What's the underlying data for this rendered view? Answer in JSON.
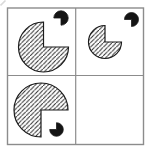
{
  "figure": {
    "width": 150,
    "height": 149,
    "colors": {
      "background": "#ffffff",
      "grid_stroke": "#8c8c8c",
      "shape_stroke": "#1b1b1b",
      "hatch_stroke": "#2a2a2a",
      "dot_fill": "#141414",
      "smudge": "#d9d9d9"
    },
    "grid": {
      "outer": {
        "x": 7.5,
        "y": 8,
        "w": 136,
        "h": 136.5
      },
      "v_divider_x": 75.7,
      "h_divider_y": 75.5,
      "outer_stroke_width": 1.4,
      "divider_stroke_width": 1.2
    },
    "hatch": {
      "spacing": 4.3,
      "stroke_width": 1.0,
      "direction": "anti-diagonal"
    },
    "smudge_line": {
      "x1": 0.5,
      "y1": 5.5,
      "x2": 5.5,
      "y2": 0.5,
      "stroke_width": 1.6
    },
    "cells": [
      {
        "id": "cell-top-left",
        "shapes": [
          {
            "name": "hatched-pacman-large",
            "type": "pacman",
            "cx": 43.5,
            "cy": 47,
            "r": 25,
            "missing_quadrant": "top-right",
            "fill": "hatch",
            "stroke_width": 1.2
          },
          {
            "name": "black-dot-notched",
            "type": "pacman",
            "cx": 61,
            "cy": 18,
            "r": 7.2,
            "missing_quadrant": "bottom-left",
            "fill": "solid",
            "stroke_width": 0.8
          }
        ]
      },
      {
        "id": "cell-top-right",
        "shapes": [
          {
            "name": "hatched-pacman-small",
            "type": "pacman",
            "cx": 105,
            "cy": 42,
            "r": 16.5,
            "missing_quadrant": "top-right",
            "fill": "hatch",
            "stroke_width": 1.2
          },
          {
            "name": "black-dot-notched",
            "type": "pacman",
            "cx": 131.5,
            "cy": 19.5,
            "r": 7,
            "missing_quadrant": "bottom-left",
            "fill": "solid",
            "stroke_width": 0.8
          }
        ]
      },
      {
        "id": "cell-bottom-left",
        "shapes": [
          {
            "name": "hatched-pacman-large",
            "type": "pacman",
            "cx": 41,
            "cy": 110,
            "r": 27,
            "missing_quadrant": "bottom-right",
            "fill": "hatch",
            "stroke_width": 1.2
          },
          {
            "name": "black-dot-notched",
            "type": "pacman",
            "cx": 56.5,
            "cy": 129.5,
            "r": 6.8,
            "missing_quadrant": "top-left",
            "fill": "solid",
            "stroke_width": 0.8
          }
        ]
      },
      {
        "id": "cell-bottom-right",
        "shapes": []
      }
    ]
  }
}
